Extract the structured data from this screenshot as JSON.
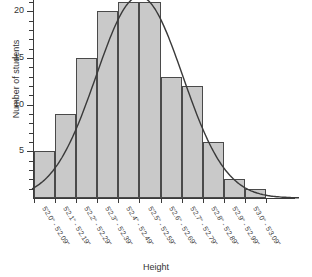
{
  "chart_data": {
    "type": "bar",
    "title": "",
    "xlabel": "Height",
    "ylabel": "Number of students",
    "categories": [
      "5'2.0\" - 5'2.09\"",
      "5'2.1\" - 5'2.19\"",
      "5'2.2\" - 5'2.29\"",
      "5'2.3\" - 5'2.39\"",
      "5'2.4\" - 5'2.49\"",
      "5'2.5\" - 5'2.59\"",
      "5'2.6\" - 5'2.69\"",
      "5'2.7\" - 5'2.79\"",
      "5'2.8\" - 5'2.89\"",
      "5'2.9\" - 5'2.99\"",
      "5'3.0\" - 5'3.09\""
    ],
    "values": [
      5,
      9,
      15,
      20,
      21,
      21,
      13,
      12,
      6,
      2,
      1
    ],
    "ylim": [
      0,
      21
    ],
    "yticks": [
      5,
      10,
      15,
      20
    ],
    "ytick_labels": [
      "5",
      "10",
      "15",
      "20"
    ],
    "yminor_step": 1,
    "grid": false,
    "legend": "none",
    "overlay": {
      "name": "normal-curve",
      "type": "line",
      "description": "fitted normal distribution curve"
    },
    "colors": {
      "bar_fill": "#c9c9c9",
      "bar_stroke": "#4a4a4a",
      "curve": "#3a3a3a",
      "axis": "#3a3a3a",
      "text": "#333333"
    }
  }
}
